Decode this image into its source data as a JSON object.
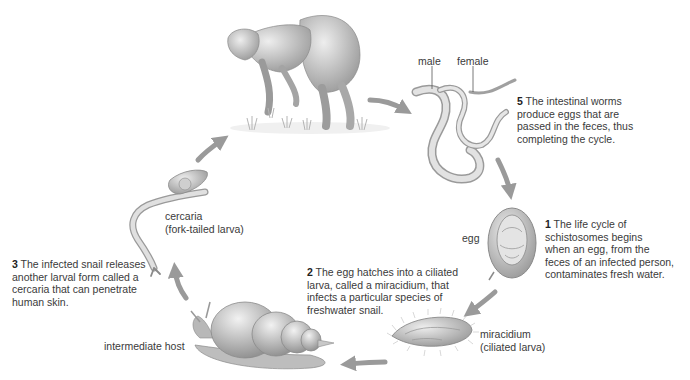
{
  "diagram": {
    "type": "life-cycle",
    "arrow_color": "#9a9a9a",
    "steps": [
      {
        "number": "1",
        "text": "The life cycle of\nschistosomes begins\nwhen an egg, from the\nfeces of an infected person,\ncontaminates fresh water."
      },
      {
        "number": "2",
        "text": "The egg hatches into a ciliated\nlarva, called a miracidium, that\ninfects a particular species of\nfreshwater snail."
      },
      {
        "number": "3",
        "text": "The infected snail releases\nanother larval form called a\ncercaria that can penetrate\nhuman skin."
      },
      {
        "number": "5",
        "text": "The intestinal worms\nproduce eggs that are\npassed in the feces, thus\ncompleting the cycle."
      }
    ],
    "labels": {
      "male": "male",
      "female": "female",
      "egg": "egg",
      "miracidium": "miracidium\n(ciliated larva)",
      "cercaria": "cercaria\n(fork-tailed larva)",
      "intermediate_host": "intermediate host"
    },
    "figures": [
      "human-host",
      "adult-worms",
      "egg",
      "miracidium",
      "snail",
      "cercaria"
    ]
  }
}
